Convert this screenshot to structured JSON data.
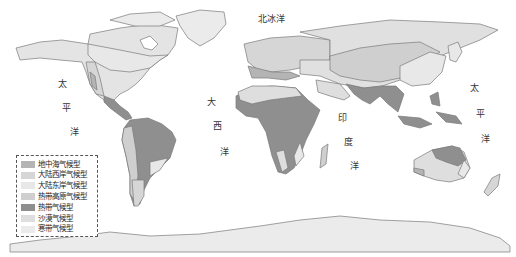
{
  "map": {
    "title": "世界气候类型分布图",
    "colors": {
      "mediterranean": "#b4b4b4",
      "west_coast": "#d6d6d6",
      "east_coast": "#e8e8e8",
      "tropical_highland": "#cfcfcf",
      "tropical": "#8f8f8f",
      "desert": "#dedede",
      "polar": "#ebebeb",
      "border": "#7a7a7a"
    }
  },
  "oceans": {
    "arctic": "北冰洋",
    "pacific_west": [
      "太",
      "平",
      "洋"
    ],
    "atlantic": [
      "大",
      "西",
      "洋"
    ],
    "indian": [
      "印",
      "度",
      "洋"
    ],
    "pacific_east": [
      "太",
      "平",
      "洋"
    ]
  },
  "legend": {
    "items": [
      {
        "label": "地中海气候型",
        "color": "#b4b4b4"
      },
      {
        "label": "大陆西岸气候型",
        "color": "#d6d6d6"
      },
      {
        "label": "大陆东岸气候型",
        "color": "#e8e8e8"
      },
      {
        "label": "热带高原气候型",
        "color": "#cfcfcf"
      },
      {
        "label": "热带气候型",
        "color": "#8f8f8f"
      },
      {
        "label": "沙漠气候型",
        "color": "#dedede"
      },
      {
        "label": "寒带气候型",
        "color": "#ebebeb"
      }
    ]
  }
}
